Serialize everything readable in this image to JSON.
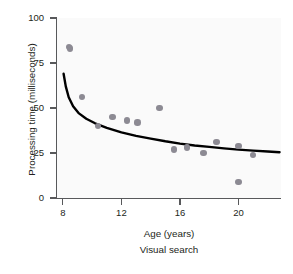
{
  "chart_data": {
    "type": "scatter",
    "title": "",
    "caption": "Visual search",
    "xlabel": "Age (years)",
    "ylabel": "Processing time (milliseconds)",
    "xlim": [
      7.6,
      22.9
    ],
    "ylim": [
      0,
      100
    ],
    "xticks": [
      8,
      12,
      16,
      20
    ],
    "yticks": [
      0,
      25,
      50,
      75,
      100
    ],
    "grid": false,
    "legend": null,
    "point_color": "#8c8a93",
    "curve_color": "#000000",
    "axis_color": "#58595b",
    "plot_background": "#fafafa",
    "series": [
      {
        "name": "Participants",
        "marker": "circle",
        "points": [
          {
            "x": 8.4,
            "y": 84
          },
          {
            "x": 8.5,
            "y": 83
          },
          {
            "x": 9.3,
            "y": 56
          },
          {
            "x": 10.4,
            "y": 40
          },
          {
            "x": 11.4,
            "y": 45
          },
          {
            "x": 12.4,
            "y": 43
          },
          {
            "x": 13.1,
            "y": 42
          },
          {
            "x": 14.6,
            "y": 50
          },
          {
            "x": 15.6,
            "y": 27
          },
          {
            "x": 16.5,
            "y": 28
          },
          {
            "x": 17.6,
            "y": 25
          },
          {
            "x": 18.5,
            "y": 31
          },
          {
            "x": 20.0,
            "y": 29
          },
          {
            "x": 20.0,
            "y": 9
          },
          {
            "x": 21.0,
            "y": 24
          }
        ]
      },
      {
        "name": "Fitted decay curve",
        "marker": "line",
        "points": [
          {
            "x": 8.05,
            "y": 69
          },
          {
            "x": 8.2,
            "y": 62
          },
          {
            "x": 8.4,
            "y": 56
          },
          {
            "x": 8.7,
            "y": 51
          },
          {
            "x": 9.1,
            "y": 47
          },
          {
            "x": 9.6,
            "y": 44
          },
          {
            "x": 10.2,
            "y": 41.5
          },
          {
            "x": 11.0,
            "y": 39
          },
          {
            "x": 12.0,
            "y": 36.5
          },
          {
            "x": 13.0,
            "y": 34.5
          },
          {
            "x": 14.0,
            "y": 33
          },
          {
            "x": 15.0,
            "y": 31.5
          },
          {
            "x": 16.0,
            "y": 30.2
          },
          {
            "x": 17.0,
            "y": 29.2
          },
          {
            "x": 18.0,
            "y": 28.4
          },
          {
            "x": 19.0,
            "y": 27.6
          },
          {
            "x": 20.0,
            "y": 26.9
          },
          {
            "x": 21.0,
            "y": 26.3
          },
          {
            "x": 22.0,
            "y": 25.8
          },
          {
            "x": 22.8,
            "y": 25.4
          }
        ]
      }
    ]
  }
}
